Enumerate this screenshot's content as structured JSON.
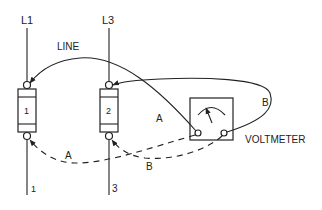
{
  "diagram": {
    "type": "wiring-diagram",
    "labels": {
      "line_l1": "L1",
      "line_l3": "L3",
      "line_caption": "LINE",
      "fuse1": "1",
      "fuse2": "2",
      "load1": "1",
      "load3": "3",
      "voltmeter": "VOLTMETER",
      "lead_a_solid": "A",
      "lead_b_solid": "B",
      "lead_a_dashed": "A",
      "lead_b_dashed": "B"
    },
    "nodes": [
      {
        "id": "L1",
        "label": "L1"
      },
      {
        "id": "L3",
        "label": "L3"
      },
      {
        "id": "fuse1",
        "label": "1"
      },
      {
        "id": "fuse2",
        "label": "2"
      },
      {
        "id": "voltmeter",
        "label": "VOLTMETER"
      },
      {
        "id": "out1",
        "label": "1"
      },
      {
        "id": "out3",
        "label": "3"
      }
    ],
    "edges": [
      {
        "from": "L1",
        "to": "fuse1",
        "style": "solid"
      },
      {
        "from": "L3",
        "to": "fuse2",
        "style": "solid"
      },
      {
        "from": "fuse1",
        "to": "out1",
        "style": "solid"
      },
      {
        "from": "fuse2",
        "to": "out3",
        "style": "solid"
      },
      {
        "from": "voltmeter",
        "to": "fuse1-line-side",
        "label": "LINE",
        "style": "solid arrow"
      },
      {
        "from": "voltmeter",
        "to": "fuse2-line-side",
        "label": "A",
        "style": "solid arrow"
      },
      {
        "from": "voltmeter",
        "to": "fuse2-line-side",
        "label": "B",
        "style": "solid loop"
      },
      {
        "from": "voltmeter",
        "to": "fuse1-load-side",
        "label": "A",
        "style": "dashed arrow"
      },
      {
        "from": "voltmeter",
        "to": "fuse2-load-side",
        "label": "B",
        "style": "dashed arrow"
      }
    ]
  }
}
